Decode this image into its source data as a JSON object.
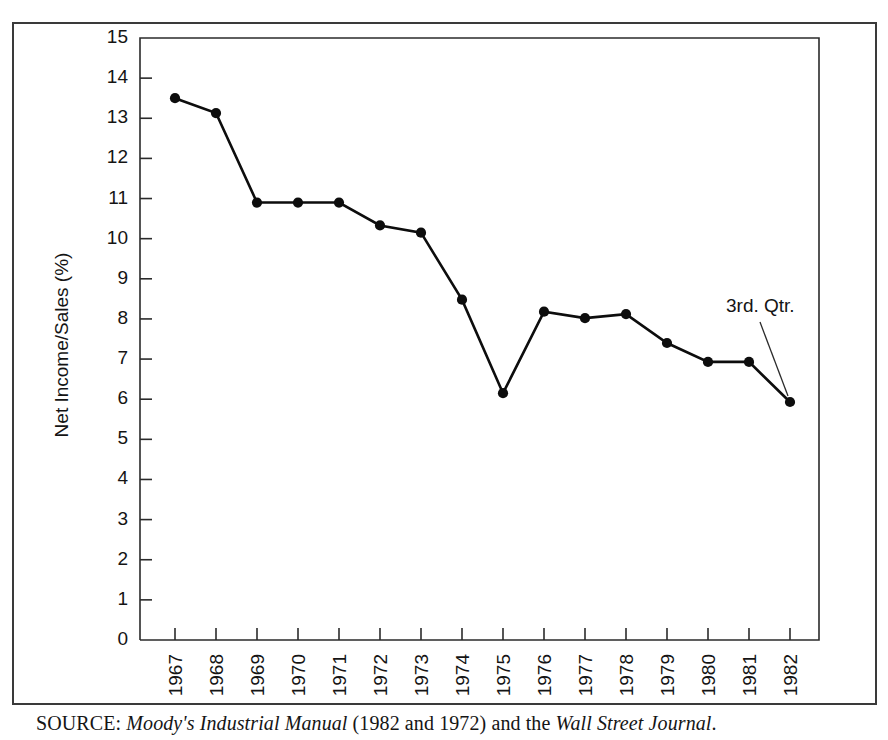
{
  "figure": {
    "source_note": {
      "label": "SOURCE:",
      "work_1": "Moody's Industrial Manual",
      "middle": "(1982 and 1972) and the",
      "work_2": "Wall Street Journal",
      "end": ".",
      "full_text": "SOURCE: Moody's Industrial Manual (1982 and 1972) and the Wall Street Journal."
    },
    "colors": {
      "line": "#0d0d0d",
      "axis": "#2b2b2b",
      "frame": "#3a3a3a",
      "background": "#ffffff",
      "text": "#141414"
    }
  },
  "chart_data": {
    "type": "line",
    "title": "",
    "xlabel": "",
    "ylabel": "Net Income/Sales (%)",
    "categories": [
      "1967",
      "1968",
      "1969",
      "1970",
      "1971",
      "1972",
      "1973",
      "1974",
      "1975",
      "1976",
      "1977",
      "1978",
      "1979",
      "1980",
      "1981",
      "1982"
    ],
    "values": [
      13.5,
      13.13,
      10.9,
      10.9,
      10.9,
      10.33,
      10.15,
      8.48,
      6.15,
      8.18,
      8.02,
      8.12,
      7.4,
      6.93,
      6.93,
      5.93
    ],
    "ylim": [
      0,
      15
    ],
    "yticks": [
      0,
      1,
      2,
      3,
      4,
      5,
      6,
      7,
      8,
      9,
      10,
      11,
      12,
      13,
      14,
      15
    ],
    "ytick_labels": [
      "0",
      "1",
      "2",
      "3",
      "4",
      "5",
      "6",
      "7",
      "8",
      "9",
      "10",
      "11",
      "12",
      "13",
      "14",
      "15"
    ],
    "grid": false,
    "legend": null,
    "markers": "filled-circle",
    "annotations": [
      {
        "text": "3rd. Qtr.",
        "points_to_category": "1982",
        "points_to_value": 5.93
      }
    ]
  }
}
